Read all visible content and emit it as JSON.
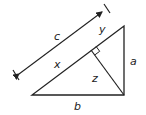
{
  "diagram": {
    "type": "right-triangle-altitude",
    "labels": {
      "c": "c",
      "y": "y",
      "x": "x",
      "z": "z",
      "a": "a",
      "b": "b"
    },
    "vertices": {
      "top": [
        124,
        26
      ],
      "right_angle": [
        124,
        95
      ],
      "left": [
        32,
        95
      ],
      "altitude_foot": [
        91,
        50
      ]
    },
    "dimension_line": {
      "label": "c",
      "start": [
        14,
        78
      ],
      "end": [
        107,
        8
      ]
    },
    "colors": {
      "stroke": "#222222",
      "background": "#ffffff"
    }
  }
}
